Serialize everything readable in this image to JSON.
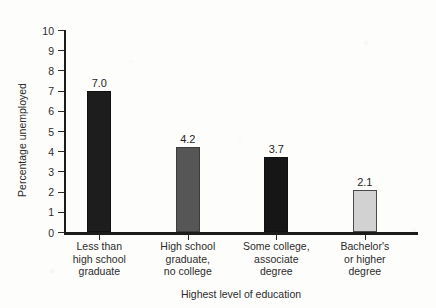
{
  "chart_data": {
    "type": "bar",
    "title": "",
    "subtitle": "",
    "xlabel": "Highest level of education",
    "ylabel": "Percentage unemployed",
    "categories": [
      "Less than\nhigh school\ngraduate",
      "High school\ngraduate,\nno college",
      "Some college,\nassociate\ndegree",
      "Bachelor's\nor higher\ndegree"
    ],
    "category_lines": [
      [
        "Less than",
        "high school",
        "graduate"
      ],
      [
        "High school",
        "graduate,",
        "no college"
      ],
      [
        "Some college,",
        "associate",
        "degree"
      ],
      [
        "Bachelor's",
        "or higher",
        "degree"
      ]
    ],
    "values": [
      7.0,
      4.2,
      3.7,
      2.1
    ],
    "value_labels": [
      "7.0",
      "4.2",
      "3.7",
      "2.1"
    ],
    "bar_colors": [
      "#1d1d1d",
      "#565656",
      "#161616",
      "#d2d2d2"
    ],
    "bar_borders": [
      "#111111",
      "#3c3c3c",
      "#111111",
      "#4a4a4a"
    ],
    "ylim": [
      0,
      10
    ],
    "ytick_values": [
      0,
      1,
      2,
      3,
      4,
      5,
      6,
      7,
      8,
      9,
      10
    ],
    "ytick_labels": [
      "0",
      "1",
      "2",
      "3",
      "4",
      "5",
      "6",
      "7",
      "8",
      "9",
      "10"
    ],
    "grid": false,
    "legend": null,
    "legend_position": "none",
    "axis_color": "#1b1b1b",
    "background_color": "#fdfdfc",
    "text_color": "#2b2b2b"
  }
}
